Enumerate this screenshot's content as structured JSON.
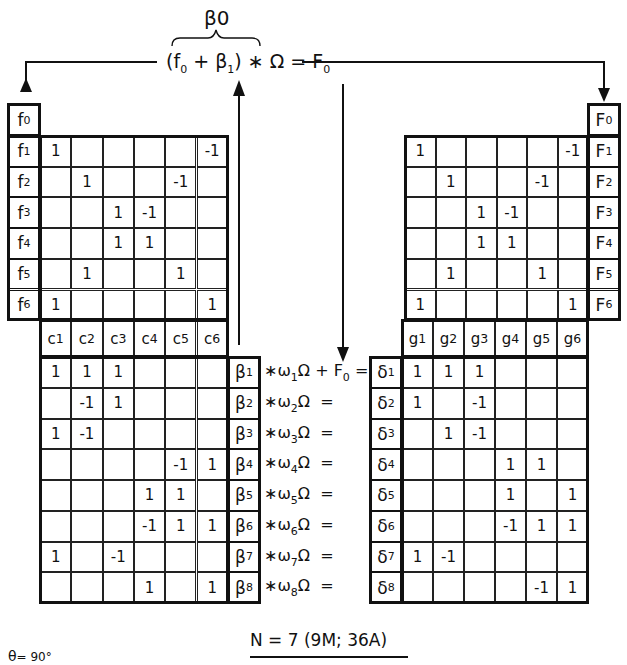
{
  "top_equation": {
    "brace_label": "β0",
    "open": "(",
    "f0": "f",
    "f0_sub": "0",
    "plus": "+",
    "beta1": "β",
    "beta1_sub": "1",
    "rest": ") ∗ Ω = ",
    "F0": "F",
    "F0_sub": "0"
  },
  "left_top": {
    "row_labels": [
      {
        "base": "f",
        "sub": "0"
      },
      {
        "base": "f",
        "sub": "1"
      },
      {
        "base": "f",
        "sub": "2"
      },
      {
        "base": "f",
        "sub": "3"
      },
      {
        "base": "f",
        "sub": "4"
      },
      {
        "base": "f",
        "sub": "5"
      },
      {
        "base": "f",
        "sub": "6"
      }
    ],
    "matrix": [
      [
        "1",
        "",
        "",
        "",
        "",
        "-1"
      ],
      [
        "",
        "1",
        "",
        "",
        "-1",
        ""
      ],
      [
        "",
        "",
        "1",
        "-1",
        "",
        ""
      ],
      [
        "",
        "",
        "1",
        "1",
        "",
        ""
      ],
      [
        "",
        "1",
        "",
        "",
        "1",
        ""
      ],
      [
        "1",
        "",
        "",
        "",
        "",
        "1"
      ]
    ],
    "col_labels": [
      {
        "base": "c",
        "sub": "1"
      },
      {
        "base": "c",
        "sub": "2"
      },
      {
        "base": "c",
        "sub": "3"
      },
      {
        "base": "c",
        "sub": "4"
      },
      {
        "base": "c",
        "sub": "5"
      },
      {
        "base": "c",
        "sub": "6"
      }
    ]
  },
  "right_top": {
    "row_labels": [
      {
        "base": "F",
        "sub": "0"
      },
      {
        "base": "F",
        "sub": "1"
      },
      {
        "base": "F",
        "sub": "2"
      },
      {
        "base": "F",
        "sub": "3"
      },
      {
        "base": "F",
        "sub": "4"
      },
      {
        "base": "F",
        "sub": "5"
      },
      {
        "base": "F",
        "sub": "6"
      }
    ],
    "matrix": [
      [
        "1",
        "",
        "",
        "",
        "",
        "-1"
      ],
      [
        "",
        "1",
        "",
        "",
        "-1",
        ""
      ],
      [
        "",
        "",
        "1",
        "-1",
        "",
        ""
      ],
      [
        "",
        "",
        "1",
        "1",
        "",
        ""
      ],
      [
        "",
        "1",
        "",
        "",
        "1",
        ""
      ],
      [
        "1",
        "",
        "",
        "",
        "",
        "1"
      ]
    ],
    "col_labels": [
      {
        "base": "g",
        "sub": "1"
      },
      {
        "base": "g",
        "sub": "2"
      },
      {
        "base": "g",
        "sub": "3"
      },
      {
        "base": "g",
        "sub": "4"
      },
      {
        "base": "g",
        "sub": "5"
      },
      {
        "base": "g",
        "sub": "6"
      }
    ]
  },
  "left_bottom": {
    "row_labels": [
      {
        "base": "β",
        "sub": "1"
      },
      {
        "base": "β",
        "sub": "2"
      },
      {
        "base": "β",
        "sub": "3"
      },
      {
        "base": "β",
        "sub": "4"
      },
      {
        "base": "β",
        "sub": "5"
      },
      {
        "base": "β",
        "sub": "6"
      },
      {
        "base": "β",
        "sub": "7"
      },
      {
        "base": "β",
        "sub": "8"
      }
    ],
    "matrix": [
      [
        "1",
        "1",
        "1",
        "",
        "",
        ""
      ],
      [
        "",
        "-1",
        "1",
        "",
        "",
        ""
      ],
      [
        "1",
        "-1",
        "",
        "",
        "",
        ""
      ],
      [
        "",
        "",
        "",
        "",
        "-1",
        "1"
      ],
      [
        "",
        "",
        "",
        "1",
        "1",
        ""
      ],
      [
        "",
        "",
        "",
        "-1",
        "1",
        "1"
      ],
      [
        "1",
        "",
        "-1",
        "",
        "",
        ""
      ],
      [
        "",
        "",
        "",
        "1",
        "",
        "1"
      ]
    ]
  },
  "right_bottom": {
    "row_labels": [
      {
        "base": "δ",
        "sub": "1"
      },
      {
        "base": "δ",
        "sub": "2"
      },
      {
        "base": "δ",
        "sub": "3"
      },
      {
        "base": "δ",
        "sub": "4"
      },
      {
        "base": "δ",
        "sub": "5"
      },
      {
        "base": "δ",
        "sub": "6"
      },
      {
        "base": "δ",
        "sub": "7"
      },
      {
        "base": "δ",
        "sub": "8"
      }
    ],
    "matrix": [
      [
        "1",
        "1",
        "1",
        "",
        "",
        ""
      ],
      [
        "1",
        "",
        "-1",
        "",
        "",
        ""
      ],
      [
        "",
        "1",
        "-1",
        "",
        "",
        ""
      ],
      [
        "",
        "",
        "",
        "1",
        "1",
        ""
      ],
      [
        "",
        "",
        "",
        "1",
        "",
        "1"
      ],
      [
        "",
        "",
        "",
        "-1",
        "1",
        "1"
      ],
      [
        "1",
        "-1",
        "",
        "",
        "",
        ""
      ],
      [
        "",
        "",
        "",
        "",
        "-1",
        "1"
      ]
    ]
  },
  "middle_equations": [
    {
      "pre": "∗ω",
      "sub": "1",
      "post": "Ω + ",
      "extra": "F",
      "extra_sub": "0",
      "eq": " ="
    },
    {
      "pre": "∗ω",
      "sub": "2",
      "post": "Ω",
      "extra": "",
      "extra_sub": "",
      "eq": "  ="
    },
    {
      "pre": "∗ω",
      "sub": "3",
      "post": "Ω",
      "extra": "",
      "extra_sub": "",
      "eq": "  ="
    },
    {
      "pre": "∗ω",
      "sub": "4",
      "post": "Ω",
      "extra": "",
      "extra_sub": "",
      "eq": "  ="
    },
    {
      "pre": "∗ω",
      "sub": "5",
      "post": "Ω",
      "extra": "",
      "extra_sub": "",
      "eq": "  ="
    },
    {
      "pre": "∗ω",
      "sub": "6",
      "post": "Ω",
      "extra": "",
      "extra_sub": "",
      "eq": "  ="
    },
    {
      "pre": "∗ω",
      "sub": "7",
      "post": "Ω",
      "extra": "",
      "extra_sub": "",
      "eq": "  ="
    },
    {
      "pre": "∗ω",
      "sub": "8",
      "post": "Ω",
      "extra": "",
      "extra_sub": "",
      "eq": "  ="
    }
  ],
  "footer": {
    "summary": "N = 7  (9M; 36A)",
    "angle_label": "θ",
    "angle_value": "= 90°"
  }
}
